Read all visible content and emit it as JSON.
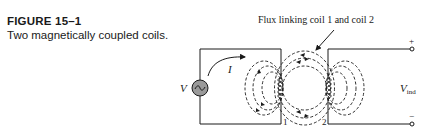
{
  "figure": {
    "label": "FIGURE 15–1",
    "description": "Two magnetically coupled coils."
  },
  "diagram": {
    "flux_annotation": "Flux linking coil 1 and coil 2",
    "source_label": "V",
    "current_label": "I",
    "coil1_label": "1",
    "coil2_label": "2",
    "output_label_main": "V",
    "output_label_sub": "ind",
    "plus_terminal": "+",
    "minus_terminal": "−",
    "source_symbol": "~"
  },
  "colors": {
    "ink": "#1a1a1a",
    "source_fill": "#9a9a9a",
    "background": "#ffffff"
  }
}
